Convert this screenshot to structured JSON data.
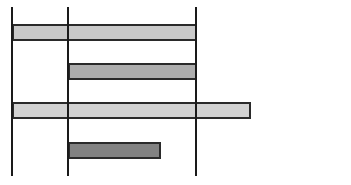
{
  "chart_data": {
    "type": "bar",
    "orientation": "horizontal",
    "title": "",
    "xlabel": "",
    "ylabel": "",
    "grid": false,
    "legend": null,
    "reference_lines_x_px": [
      12,
      68,
      196
    ],
    "line_top_px": 7,
    "line_bottom_px": 176,
    "bars": [
      {
        "start_px": 12,
        "end_px": 196,
        "top_px": 24,
        "height_px": 17,
        "color": "#c9c9c9"
      },
      {
        "start_px": 68,
        "end_px": 196,
        "top_px": 63,
        "height_px": 17,
        "color": "#adadad"
      },
      {
        "start_px": 12,
        "end_px": 250,
        "top_px": 102,
        "height_px": 17,
        "color": "#d2d2d2"
      },
      {
        "start_px": 68,
        "end_px": 160,
        "top_px": 142,
        "height_px": 17,
        "color": "#828282"
      }
    ]
  },
  "colors": {
    "background": "#ffffff",
    "line": "#1a1a1a",
    "bar_border": "#2a2a2a"
  }
}
